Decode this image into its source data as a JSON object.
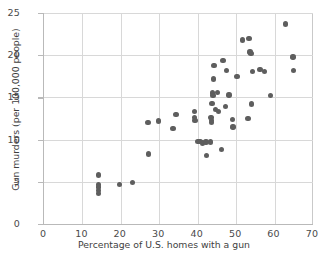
{
  "chart_data": {
    "type": "scatter",
    "title": "",
    "xlabel": "Percentage of U.S. homes with a gun",
    "ylabel": "Gun murders (per 100,000 people)",
    "xlim": [
      0,
      70
    ],
    "ylim": [
      0,
      25
    ],
    "xticks": [
      0,
      10,
      20,
      30,
      40,
      50,
      60,
      70
    ],
    "yticks": [
      0,
      5,
      10,
      15,
      20,
      25
    ],
    "grid": true,
    "legend": null,
    "marker_color": "#5e5e5e",
    "grid_color": "#d8d8d8",
    "axis_color": "#b9b9b9",
    "points": [
      {
        "x": 14.2,
        "y": 5.8
      },
      {
        "x": 14.2,
        "y": 4.7
      },
      {
        "x": 14.2,
        "y": 4.4
      },
      {
        "x": 14.2,
        "y": 4.0
      },
      {
        "x": 14.2,
        "y": 3.6
      },
      {
        "x": 19.6,
        "y": 4.7
      },
      {
        "x": 23.1,
        "y": 4.9
      },
      {
        "x": 27.2,
        "y": 8.3
      },
      {
        "x": 27.1,
        "y": 12.0
      },
      {
        "x": 29.8,
        "y": 12.2
      },
      {
        "x": 33.6,
        "y": 11.3
      },
      {
        "x": 34.3,
        "y": 13.0
      },
      {
        "x": 39.1,
        "y": 13.3
      },
      {
        "x": 39.2,
        "y": 12.6
      },
      {
        "x": 39.3,
        "y": 12.3
      },
      {
        "x": 40.1,
        "y": 9.8
      },
      {
        "x": 40.6,
        "y": 9.8
      },
      {
        "x": 41.2,
        "y": 9.6
      },
      {
        "x": 42.2,
        "y": 9.7
      },
      {
        "x": 42.3,
        "y": 8.1
      },
      {
        "x": 43.4,
        "y": 9.7
      },
      {
        "x": 43.5,
        "y": 12.6
      },
      {
        "x": 43.6,
        "y": 12.3
      },
      {
        "x": 43.6,
        "y": 12.0
      },
      {
        "x": 43.7,
        "y": 14.3
      },
      {
        "x": 43.9,
        "y": 15.5
      },
      {
        "x": 44.0,
        "y": 15.2
      },
      {
        "x": 44.1,
        "y": 17.2
      },
      {
        "x": 44.2,
        "y": 18.8
      },
      {
        "x": 44.6,
        "y": 13.6
      },
      {
        "x": 45.2,
        "y": 15.6
      },
      {
        "x": 45.4,
        "y": 13.3
      },
      {
        "x": 46.2,
        "y": 8.8
      },
      {
        "x": 46.6,
        "y": 19.4
      },
      {
        "x": 47.3,
        "y": 13.9
      },
      {
        "x": 47.5,
        "y": 18.2
      },
      {
        "x": 48.1,
        "y": 15.3
      },
      {
        "x": 49.1,
        "y": 12.4
      },
      {
        "x": 49.2,
        "y": 11.5
      },
      {
        "x": 50.2,
        "y": 17.5
      },
      {
        "x": 51.7,
        "y": 21.8
      },
      {
        "x": 53.1,
        "y": 12.5
      },
      {
        "x": 53.3,
        "y": 22.0
      },
      {
        "x": 53.6,
        "y": 20.4
      },
      {
        "x": 53.9,
        "y": 20.2
      },
      {
        "x": 54.0,
        "y": 14.2
      },
      {
        "x": 54.2,
        "y": 18.1
      },
      {
        "x": 56.2,
        "y": 18.3
      },
      {
        "x": 57.3,
        "y": 18.1
      },
      {
        "x": 58.9,
        "y": 15.2
      },
      {
        "x": 62.8,
        "y": 23.7
      },
      {
        "x": 64.8,
        "y": 19.8
      },
      {
        "x": 65.0,
        "y": 18.2
      }
    ]
  }
}
